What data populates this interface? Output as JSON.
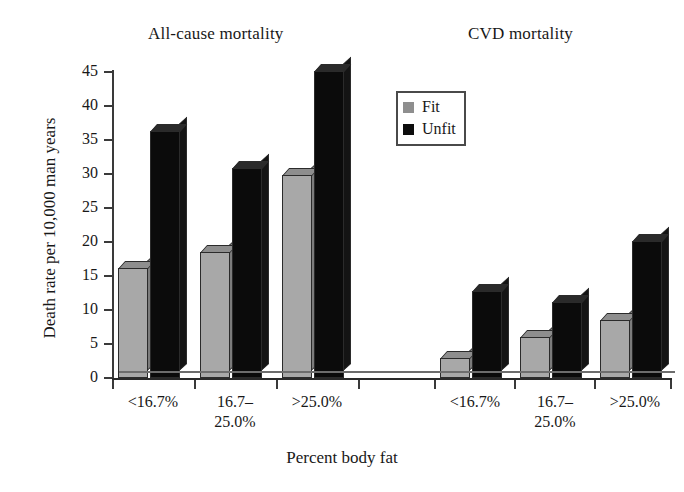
{
  "figure": {
    "panel_titles": {
      "left": "All-cause mortality",
      "right": "CVD mortality"
    },
    "y_axis_title": "Death rate per 10,000 man years",
    "x_axis_title": "Percent body fat"
  },
  "legend": {
    "items": [
      {
        "label": "Fit",
        "color": "#8e8e8e",
        "swatch": "fit-swatch"
      },
      {
        "label": "Unfit",
        "color": "#0d0d0d",
        "swatch": "unfit-swatch"
      }
    ]
  },
  "axis": {
    "y_ticks": [
      "0",
      "5",
      "10",
      "15",
      "20",
      "25",
      "30",
      "35",
      "40",
      "45"
    ],
    "x_ticks_left": [
      "<16.7%",
      "16.7–\n25.0%",
      ">25.0%"
    ],
    "x_ticks_right": [
      "<16.7%",
      "16.7–\n25.0%",
      ">25.0%"
    ]
  },
  "x_labels": {
    "l1": "<16.7%",
    "l2a": "16.7–",
    "l2b": "25.0%",
    "l3": ">25.0%",
    "r1": "<16.7%",
    "r2a": "16.7–",
    "r2b": "25.0%",
    "r3": ">25.0%"
  },
  "chart_data": {
    "type": "bar",
    "title": "",
    "xlabel": "Percent body fat",
    "ylabel": "Death rate per 10,000 man years",
    "ylim": [
      0,
      45
    ],
    "ytick_step": 5,
    "grid": false,
    "legend_position": "upper center",
    "panels": [
      {
        "name": "All-cause mortality",
        "categories": [
          "<16.7%",
          "16.7–25.0%",
          ">25.0%"
        ],
        "series": [
          {
            "name": "Fit",
            "color": "#a8a8a8",
            "values": [
              16.2,
              18.5,
              29.8
            ]
          },
          {
            "name": "Unfit",
            "color": "#0b0b0b",
            "values": [
              36.3,
              30.9,
              45.2
            ]
          }
        ]
      },
      {
        "name": "CVD mortality",
        "categories": [
          "<16.7%",
          "16.7–25.0%",
          ">25.0%"
        ],
        "series": [
          {
            "name": "Fit",
            "color": "#a8a8a8",
            "values": [
              2.9,
              6.1,
              8.5
            ]
          },
          {
            "name": "Unfit",
            "color": "#0b0b0b",
            "values": [
              12.8,
              11.2,
              20.1
            ]
          }
        ]
      }
    ]
  }
}
